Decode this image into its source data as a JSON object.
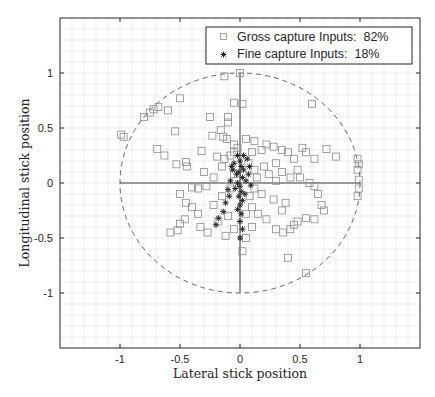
{
  "chart_data": {
    "type": "scatter",
    "title": "",
    "xlabel": "Lateral stick position",
    "ylabel": "Longitudinal stick position",
    "xlim": [
      -1.5,
      1.5
    ],
    "ylim": [
      -1.5,
      1.5
    ],
    "xticks": [
      -1,
      -0.5,
      0,
      0.5,
      1
    ],
    "xtick_labels": [
      "-1",
      "-0.5",
      "0",
      "0.5",
      "1"
    ],
    "yticks": [
      1,
      0.5,
      0,
      -0.5,
      -1
    ],
    "ytick_labels": [
      "1",
      "0.5",
      "0",
      "-0.5",
      "-1"
    ],
    "grid": "minor grid on, 0.1 spacing",
    "legend_position": "upper right",
    "annotations": [
      "dashed unit circle (radius 1)",
      "crosshair lines x=0 and y=0 from -1 to 1"
    ],
    "series": [
      {
        "name": "Gross capture Inputs:  82%",
        "marker": "square",
        "color": "#8c8c8c",
        "points": [
          [
            -0.99,
            0.44
          ],
          [
            -0.97,
            0.42
          ],
          [
            -0.8,
            0.6
          ],
          [
            -0.75,
            0.64
          ],
          [
            -0.72,
            0.67
          ],
          [
            -0.68,
            0.69
          ],
          [
            -0.6,
            0.66
          ],
          [
            -0.5,
            0.77
          ],
          [
            -0.54,
            0.47
          ],
          [
            -0.69,
            0.31
          ],
          [
            -0.63,
            0.25
          ],
          [
            -0.53,
            0.17
          ],
          [
            -0.45,
            0.19
          ],
          [
            -0.44,
            0.15
          ],
          [
            -0.32,
            0.29
          ],
          [
            -0.25,
            0.6
          ],
          [
            -0.13,
            0.97
          ],
          [
            -0.05,
            0.73
          ],
          [
            -0.1,
            0.6
          ],
          [
            -0.1,
            0.55
          ],
          [
            -0.16,
            0.48
          ],
          [
            -0.23,
            0.43
          ],
          [
            -0.14,
            0.42
          ],
          [
            -0.11,
            0.4
          ],
          [
            -0.05,
            0.35
          ],
          [
            -0.02,
            0.32
          ],
          [
            -0.05,
            0.28
          ],
          [
            -0.19,
            0.24
          ],
          [
            -0.13,
            0.22
          ],
          [
            -0.08,
            0.25
          ],
          [
            -0.3,
            0.1
          ],
          [
            -0.15,
            0.15
          ],
          [
            -0.22,
            0.05
          ],
          [
            -0.28,
            -0.03
          ],
          [
            -0.35,
            -0.05
          ],
          [
            -0.4,
            -0.04
          ],
          [
            -0.5,
            -0.1
          ],
          [
            -0.45,
            -0.18
          ],
          [
            -0.4,
            -0.22
          ],
          [
            -0.46,
            -0.33
          ],
          [
            -0.5,
            -0.37
          ],
          [
            -0.52,
            -0.43
          ],
          [
            -0.58,
            -0.45
          ],
          [
            -0.33,
            -0.4
          ],
          [
            -0.27,
            -0.45
          ],
          [
            -0.35,
            -0.28
          ],
          [
            -0.22,
            -0.2
          ],
          [
            -0.15,
            -0.12
          ],
          [
            -0.1,
            -0.3
          ],
          [
            -0.18,
            -0.35
          ],
          [
            -0.12,
            -0.48
          ],
          [
            -0.05,
            -0.42
          ],
          [
            -0.08,
            -0.05
          ],
          [
            -0.05,
            0.08
          ],
          [
            0.02,
            0.72
          ],
          [
            0.6,
            0.72
          ],
          [
            0.0,
            1.0
          ],
          [
            0.05,
            0.4
          ],
          [
            0.12,
            0.38
          ],
          [
            0.18,
            0.3
          ],
          [
            0.1,
            0.28
          ],
          [
            0.22,
            0.35
          ],
          [
            0.28,
            0.33
          ],
          [
            0.35,
            0.3
          ],
          [
            0.4,
            0.28
          ],
          [
            0.45,
            0.22
          ],
          [
            0.52,
            0.32
          ],
          [
            0.55,
            0.28
          ],
          [
            0.62,
            0.22
          ],
          [
            0.72,
            0.31
          ],
          [
            0.8,
            0.24
          ],
          [
            0.98,
            0.22
          ],
          [
            0.99,
            0.17
          ],
          [
            0.98,
            0.12
          ],
          [
            0.99,
            0.03
          ],
          [
            0.99,
            -0.05
          ],
          [
            0.98,
            -0.12
          ],
          [
            0.12,
            0.12
          ],
          [
            0.2,
            0.15
          ],
          [
            0.3,
            0.18
          ],
          [
            0.35,
            0.1
          ],
          [
            0.42,
            0.05
          ],
          [
            0.48,
            0.12
          ],
          [
            0.5,
            0.05
          ],
          [
            0.58,
            0.0
          ],
          [
            0.62,
            -0.03
          ],
          [
            0.65,
            -0.1
          ],
          [
            0.68,
            -0.2
          ],
          [
            0.7,
            -0.25
          ],
          [
            0.62,
            -0.33
          ],
          [
            0.55,
            -0.32
          ],
          [
            0.48,
            -0.35
          ],
          [
            0.45,
            -0.38
          ],
          [
            0.42,
            -0.42
          ],
          [
            0.36,
            -0.45
          ],
          [
            0.3,
            -0.42
          ],
          [
            0.22,
            -0.33
          ],
          [
            0.15,
            -0.28
          ],
          [
            0.1,
            -0.22
          ],
          [
            0.08,
            -0.12
          ],
          [
            0.12,
            -0.05
          ],
          [
            0.18,
            -0.1
          ],
          [
            0.28,
            -0.15
          ],
          [
            0.35,
            -0.25
          ],
          [
            0.38,
            -0.18
          ],
          [
            0.1,
            -0.4
          ],
          [
            0.05,
            -0.5
          ],
          [
            0.02,
            -0.62
          ],
          [
            0.4,
            -0.68
          ],
          [
            0.55,
            -0.82
          ],
          [
            0.05,
            -0.28
          ],
          [
            0.07,
            0.18
          ],
          [
            0.14,
            0.05
          ],
          [
            0.24,
            0.08
          ],
          [
            0.3,
            0.02
          ]
        ]
      },
      {
        "name": "Fine capture Inputs:  18%",
        "marker": "asterisk",
        "color": "#262626",
        "points": [
          [
            0.0,
            0.2
          ],
          [
            0.01,
            0.15
          ],
          [
            -0.01,
            0.1
          ],
          [
            0.02,
            0.05
          ],
          [
            -0.02,
            0.0
          ],
          [
            0.0,
            -0.03
          ],
          [
            0.01,
            -0.08
          ],
          [
            -0.01,
            -0.12
          ],
          [
            0.02,
            -0.16
          ],
          [
            0.0,
            -0.2
          ],
          [
            -0.02,
            -0.24
          ],
          [
            0.01,
            -0.28
          ],
          [
            0.03,
            0.12
          ],
          [
            -0.03,
            0.08
          ],
          [
            0.05,
            0.02
          ],
          [
            -0.04,
            -0.05
          ],
          [
            0.04,
            -0.1
          ],
          [
            -0.05,
            0.18
          ],
          [
            0.06,
            0.22
          ],
          [
            -0.06,
            0.12
          ],
          [
            0.07,
            0.08
          ],
          [
            -0.08,
            0.02
          ],
          [
            0.09,
            -0.02
          ],
          [
            -0.1,
            -0.06
          ],
          [
            -0.12,
            -0.18
          ],
          [
            -0.14,
            -0.26
          ],
          [
            -0.18,
            -0.32
          ],
          [
            -0.2,
            -0.38
          ],
          [
            0.0,
            -0.35
          ],
          [
            0.02,
            -0.42
          ],
          [
            0.0,
            -0.5
          ],
          [
            -0.07,
            0.15
          ],
          [
            0.03,
            0.25
          ],
          [
            -0.02,
            0.25
          ],
          [
            0.08,
            0.15
          ],
          [
            -0.09,
            -0.12
          ]
        ]
      }
    ]
  },
  "legend": {
    "items": [
      {
        "label": "Gross capture Inputs:  82%",
        "marker": "square"
      },
      {
        "label": "Fine capture Inputs:  18%",
        "marker": "asterisk"
      }
    ]
  },
  "axes": {
    "xlabel": "Lateral stick position",
    "ylabel": "Longitudinal stick position"
  }
}
